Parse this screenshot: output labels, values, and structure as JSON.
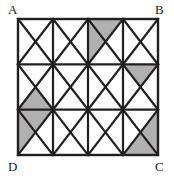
{
  "figure": {
    "kind": "geometry-diagram",
    "labels": {
      "top_left": "A",
      "top_right": "B",
      "bottom_right": "C",
      "bottom_left": "D"
    },
    "colors": {
      "stroke": "#231f20",
      "shade_fill": "#b0b0b0",
      "cell_fill": "#ffffff",
      "background": "#ffffff",
      "label_color": "#1a1a1a"
    },
    "geometry": {
      "origin_x": 18,
      "origin_y": 19,
      "grid_width": 140,
      "grid_height": 136,
      "columns": 4,
      "rows": 3,
      "cell_width": 35,
      "cell_height": 45.3333,
      "outer_stroke_width": 2.4,
      "grid_stroke_width": 2.2,
      "diagonal_stroke_width": 2.2
    },
    "shaded_triangles": [
      {
        "col": 2,
        "row": 0,
        "part": "top"
      },
      {
        "col": 2,
        "row": 0,
        "part": "left"
      },
      {
        "col": 3,
        "row": 1,
        "part": "top"
      },
      {
        "col": 0,
        "row": 1,
        "part": "bottom"
      },
      {
        "col": 0,
        "row": 2,
        "part": "left"
      },
      {
        "col": 0,
        "row": 2,
        "part": "top"
      },
      {
        "col": 3,
        "row": 2,
        "part": "right"
      },
      {
        "col": 3,
        "row": 2,
        "part": "bottom"
      }
    ]
  }
}
